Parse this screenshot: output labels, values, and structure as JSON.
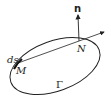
{
  "diagram": {
    "curve_label": "Γ",
    "point_m_label": "M",
    "point_n_label": "N",
    "element_label": "ds",
    "normal_label": "n"
  }
}
